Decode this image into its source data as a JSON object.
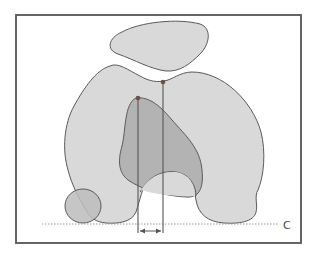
{
  "diagram": {
    "type": "anatomical-schematic",
    "labels": {
      "baseline": "C"
    },
    "colors": {
      "background": "#ffffff",
      "frame": "#555555",
      "outline": "#5a5a5a",
      "light_fill": "#d9d9d9",
      "dark_fill": "#b3b3b3",
      "overlap_fill": "#bcbcbc",
      "marker": "#6a5050",
      "baseline": "#9a9a9a"
    },
    "elements": [
      {
        "name": "top-blob",
        "description": "small rounded shape above main shape"
      },
      {
        "name": "main-shape",
        "description": "large two-lobed shape with a notch at the top and an arch at the bottom"
      },
      {
        "name": "inner-shape",
        "description": "darker overlapping inner region"
      },
      {
        "name": "small-circle",
        "description": "small oval at bottom-left"
      },
      {
        "name": "reference-line-1",
        "description": "vertical line from left marker point to below baseline"
      },
      {
        "name": "reference-line-2",
        "description": "vertical line from right marker point to below baseline"
      },
      {
        "name": "offset-arrow",
        "description": "double-headed arrow showing horizontal offset between the two reference lines"
      },
      {
        "name": "baseline",
        "description": "dotted horizontal line labelled C"
      }
    ]
  }
}
